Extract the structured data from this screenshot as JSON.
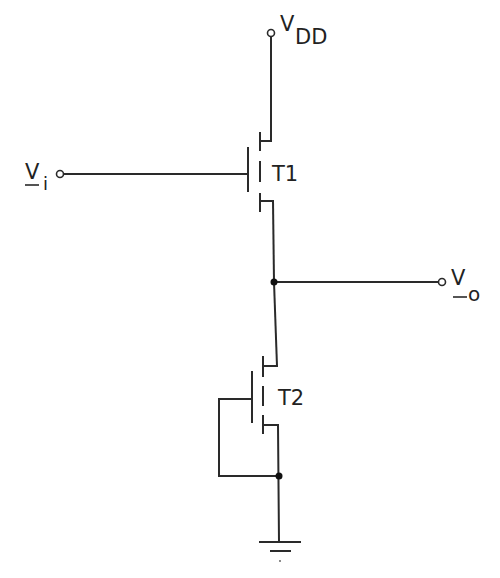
{
  "diagram": {
    "type": "circuit-schematic",
    "labels": {
      "vdd": {
        "main": "V",
        "sub": "DD"
      },
      "vi": {
        "main": "V",
        "sub": "i"
      },
      "vo": {
        "main": "V",
        "sub": "o"
      },
      "t1": "T1",
      "t2": "T2"
    },
    "nodes": [
      "VDD",
      "Vi",
      "Vo",
      "GND"
    ],
    "components": [
      {
        "id": "T1",
        "kind": "MOSFET",
        "gate": "Vi",
        "drain": "VDD",
        "source": "Vo"
      },
      {
        "id": "T2",
        "kind": "MOSFET",
        "gate": "GND",
        "drain": "Vo",
        "source": "GND"
      }
    ],
    "colors": {
      "stroke": "#2a2a2a",
      "background": "#ffffff"
    }
  }
}
